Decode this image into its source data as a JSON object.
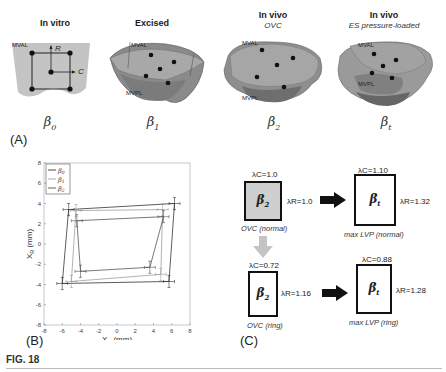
{
  "panel_a": {
    "label": "(A)",
    "columns": [
      {
        "title": "In vitro",
        "subtitle": "",
        "beta_symbol": "β",
        "beta_sub": "0",
        "labels": [
          "MVAL"
        ],
        "axis_labels": {
          "r": "R",
          "c": "C"
        }
      },
      {
        "title": "Excised",
        "subtitle": "",
        "beta_symbol": "β",
        "beta_sub": "1",
        "labels": [
          "MVAL",
          "MVPL"
        ]
      },
      {
        "title": "In vivo",
        "subtitle": "OVC",
        "beta_symbol": "β",
        "beta_sub": "2",
        "labels": [
          "MVAL",
          "MVPL"
        ]
      },
      {
        "title": "In vivo",
        "subtitle": "ES pressure-loaded",
        "beta_symbol": "β",
        "beta_sub": "t",
        "labels": [
          "MVAL",
          "MVPL"
        ]
      }
    ]
  },
  "panel_b": {
    "label": "(B)"
  },
  "panel_c": {
    "label": "(C)",
    "boxes": [
      {
        "id": "ovc-normal",
        "beta": "β",
        "beta_sub": "2",
        "lambda_c": "λC=1.0",
        "lambda_r": "λR=1.0",
        "caption": "OVC (normal)",
        "filled": true
      },
      {
        "id": "maxlvp-normal",
        "beta": "β",
        "beta_sub": "t",
        "lambda_c": "λC=1.10",
        "lambda_r": "λR=1.32",
        "caption": "max LVP (normal)",
        "filled": false
      },
      {
        "id": "ovc-ring",
        "beta": "β",
        "beta_sub": "2",
        "lambda_c": "λC=0.72",
        "lambda_r": "λR=1.16",
        "caption": "OVC (ring)",
        "filled": false
      },
      {
        "id": "maxlvp-ring",
        "beta": "β",
        "beta_sub": "t",
        "lambda_c": "λC=0.88",
        "lambda_r": "λR=1.28",
        "caption": "max LVP (ring)",
        "filled": false
      }
    ]
  },
  "figure_label": "FIG. 18",
  "chart_data": {
    "type": "line",
    "title": "",
    "xlabel": "X_C (mm)",
    "ylabel": "X_R (mm)",
    "xlim": [
      -8,
      8
    ],
    "ylim": [
      -8,
      8
    ],
    "xticks": [
      -8,
      -6,
      -4,
      -2,
      0,
      2,
      4,
      6,
      8
    ],
    "yticks": [
      -8,
      -6,
      -4,
      -2,
      0,
      2,
      4,
      6,
      8
    ],
    "grid": false,
    "legend_position": "upper left",
    "legend": [
      "β0",
      "β1",
      "β2"
    ],
    "series": [
      {
        "name": "β0",
        "color": "#333333",
        "closed": true,
        "points": [
          [
            -5.3,
            3.4
          ],
          [
            6.3,
            4.0
          ],
          [
            5.7,
            -3.7
          ],
          [
            -6.0,
            -3.9
          ]
        ]
      },
      {
        "name": "β1",
        "color": "#a0a0a0",
        "closed": true,
        "points": [
          [
            -4.5,
            3.3
          ],
          [
            5.0,
            3.4
          ],
          [
            4.8,
            -3.0
          ],
          [
            -5.0,
            -3.7
          ]
        ]
      },
      {
        "name": "β2",
        "color": "#555555",
        "closed": true,
        "points": [
          [
            -4.4,
            2.3
          ],
          [
            5.1,
            2.7
          ],
          [
            3.6,
            -2.3
          ],
          [
            -4.0,
            -2.7
          ]
        ]
      }
    ],
    "error_bars": "horizontal and vertical error bars at each vertex (~±0.5–0.7 mm)"
  }
}
